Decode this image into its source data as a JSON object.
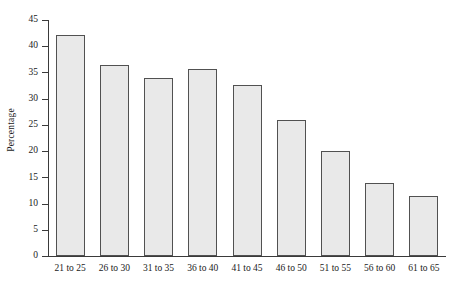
{
  "chart_data": {
    "type": "bar",
    "title": "",
    "subtitle": "",
    "xlabel": "",
    "ylabel": "Percentage",
    "categories": [
      "21 to 25",
      "26 to 30",
      "31 to 35",
      "36 to 40",
      "41 to 45",
      "46 to 50",
      "51 to 55",
      "56 to 60",
      "61 to 65"
    ],
    "values": [
      42.1,
      36.5,
      34.0,
      35.6,
      32.6,
      25.9,
      20.1,
      14.0,
      11.5
    ],
    "ylim": [
      0,
      45
    ],
    "ytick_labels": [
      "0",
      "5",
      "10",
      "15",
      "20",
      "25",
      "30",
      "35",
      "40",
      "45"
    ],
    "ytick_values": [
      0,
      5,
      10,
      15,
      20,
      25,
      30,
      35,
      40,
      45
    ],
    "grid": false,
    "legend": "none",
    "bar_fill_color": "#e9e9e9",
    "bar_border_color": "#515151",
    "axis_color": "#3a3a3a",
    "background_color": "#ffffff"
  }
}
